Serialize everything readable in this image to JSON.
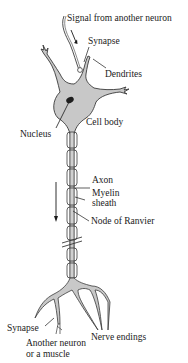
{
  "diagram": {
    "colors": {
      "fill": "#c8c8c8",
      "stroke": "#3a3a3a",
      "nucleus": "#1e1e1e",
      "text": "#1a1a1a",
      "background": "#ffffff"
    },
    "labels": {
      "signal": "Signal from another neuron",
      "synapse_top": "Synapse",
      "dendrites": "Dendrites",
      "nucleus": "Nucleus",
      "cell_body": "Cell body",
      "axon": "Axon",
      "myelin_line1": "Myelin",
      "myelin_line2": "sheath",
      "node": "Node of Ranvier",
      "synapse_bottom": "Synapse",
      "target_line1": "Another neuron",
      "target_line2": "or a muscle",
      "nerve_endings": "Nerve endings"
    },
    "icons": {
      "signal_arrow": "arrow-down",
      "conduction_arrow": "arrow-down",
      "break_mark": "double-slash"
    }
  }
}
